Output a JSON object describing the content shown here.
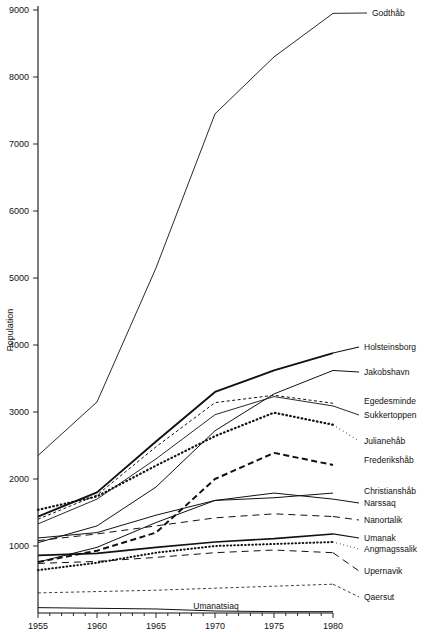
{
  "chart_data": {
    "type": "line",
    "title": "",
    "subtitle": "",
    "xlabel": "",
    "ylabel": "Population",
    "x": [
      1955,
      1960,
      1965,
      1970,
      1975,
      1980
    ],
    "xticklabels": [
      "1955",
      "1960",
      "1965",
      "1970",
      "1975",
      "1980"
    ],
    "yticklabels": [
      "1000",
      "2000",
      "3000",
      "4000",
      "5000",
      "6000",
      "7000",
      "8000",
      "9000"
    ],
    "yticks": [
      1000,
      2000,
      3000,
      4000,
      5000,
      6000,
      7000,
      8000,
      9000
    ],
    "xlim": [
      1955,
      1980
    ],
    "ylim": [
      0,
      9200
    ],
    "grid": false,
    "legend_position": "right-inline-labels",
    "series": [
      {
        "name": "Godthåb",
        "values": [
          2350,
          3150,
          5150,
          7450,
          8300,
          8950
        ],
        "style": "solid",
        "width": 0.9,
        "label_x": 372,
        "label_y": 16
      },
      {
        "name": "Holsteinsborg",
        "values": [
          1440,
          1800,
          2560,
          3300,
          3620,
          3880
        ],
        "style": "solid",
        "width": 1.9,
        "label_x": 364,
        "label_y": 350
      },
      {
        "name": "Jakobshavn",
        "values": [
          1050,
          1300,
          1880,
          2720,
          3270,
          3620
        ],
        "style": "solid",
        "width": 1.0,
        "label_x": 364,
        "label_y": 375
      },
      {
        "name": "Egedesminde",
        "values": [
          1400,
          1760,
          2480,
          3140,
          3250,
          3130
        ],
        "style": "dashed-fine",
        "width": 1.0,
        "label_x": 364,
        "label_y": 404
      },
      {
        "name": "Sukkertoppen",
        "values": [
          1330,
          1700,
          2300,
          2960,
          3230,
          3090
        ],
        "style": "solid",
        "width": 0.9,
        "label_x": 364,
        "label_y": 418
      },
      {
        "name": "Julianehåb",
        "values": [
          1540,
          1740,
          2200,
          2640,
          2990,
          2810
        ],
        "style": "dotted",
        "width": 2.2,
        "label_x": 364,
        "label_y": 444
      },
      {
        "name": "Frederikshåb",
        "values": [
          760,
          930,
          1200,
          2000,
          2390,
          2210
        ],
        "style": "dashed-bold",
        "width": 2.0,
        "label_x": 364,
        "label_y": 463
      },
      {
        "name": "Christianshåb",
        "values": [
          1120,
          1200,
          1460,
          1680,
          1720,
          1790
        ],
        "style": "solid",
        "width": 1.0,
        "label_x": 364,
        "label_y": 494
      },
      {
        "name": "Narssaq",
        "values": [
          760,
          980,
          1350,
          1680,
          1790,
          1700
        ],
        "style": "solid",
        "width": 1.0,
        "label_x": 364,
        "label_y": 506
      },
      {
        "name": "Nanortalik",
        "values": [
          1080,
          1180,
          1300,
          1420,
          1480,
          1440
        ],
        "style": "dashed-long",
        "width": 1.0,
        "label_x": 364,
        "label_y": 523
      },
      {
        "name": "Umanak",
        "values": [
          860,
          890,
          980,
          1060,
          1110,
          1180
        ],
        "style": "solid",
        "width": 1.6,
        "label_x": 364,
        "label_y": 541
      },
      {
        "name": "Angmagssalik",
        "values": [
          640,
          750,
          900,
          1000,
          1030,
          1060
        ],
        "style": "dotted",
        "width": 2.0,
        "label_x": 364,
        "label_y": 552
      },
      {
        "name": "Upernavik",
        "values": [
          740,
          770,
          830,
          900,
          940,
          900
        ],
        "style": "dashed-long",
        "width": 1.0,
        "label_x": 364,
        "label_y": 574
      },
      {
        "name": "Qaersut",
        "values": [
          300,
          320,
          340,
          370,
          400,
          430
        ],
        "style": "dashed-fine",
        "width": 0.8,
        "label_x": 364,
        "label_y": 600
      },
      {
        "name": "Umanatsiaq",
        "values": [
          80,
          70,
          60,
          30,
          20,
          20
        ],
        "style": "solid",
        "width": 1.0,
        "label_x": 216,
        "label_y": 609
      }
    ]
  },
  "axes": {
    "y_axis_title": "Population",
    "x_axis_title": ""
  },
  "labels": {
    "inline_umanatsiaq": "Umanatsiaq"
  }
}
